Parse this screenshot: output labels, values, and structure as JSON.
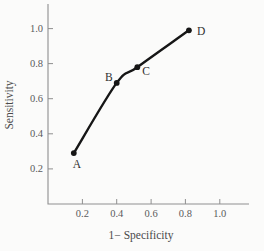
{
  "chart_data": {
    "type": "line",
    "title": "",
    "xlabel": "1− Specificity",
    "ylabel": "Sensitivity",
    "xlim": [
      0,
      1.17
    ],
    "ylim": [
      0,
      1.14
    ],
    "x_ticks": [
      0.2,
      0.4,
      0.6,
      0.8,
      1.0
    ],
    "y_ticks": [
      0.2,
      0.4,
      0.6,
      0.8,
      1.0
    ],
    "grid": false,
    "legend": "none",
    "series": [
      {
        "name": "ROC curve",
        "points": [
          {
            "label": "A",
            "x": 0.15,
            "y": 0.29,
            "label_anchor": "middle",
            "label_dx": 3,
            "label_dy": 15
          },
          {
            "label": "B",
            "x": 0.4,
            "y": 0.69,
            "label_anchor": "end",
            "label_dx": -4,
            "label_dy": -2
          },
          {
            "label": "C",
            "x": 0.52,
            "y": 0.78,
            "label_anchor": "start",
            "label_dx": 5,
            "label_dy": 8
          },
          {
            "label": "D",
            "x": 0.82,
            "y": 0.99,
            "label_anchor": "start",
            "label_dx": 8,
            "label_dy": 5
          }
        ]
      }
    ],
    "colors": {
      "curve": "#161616",
      "point": "#161616",
      "axis": "#8f8f8f",
      "tick_text": "#5a5a5a",
      "axis_title_text": "#4a4a4a",
      "point_label_text": "#303030",
      "background": "#fbfbfa"
    }
  }
}
